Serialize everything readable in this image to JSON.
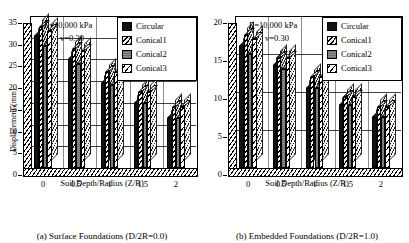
{
  "figure": {
    "series_names": [
      "Circular",
      "Conical1",
      "Conical2",
      "Conical3"
    ],
    "annotations": {
      "modulus": "E=10,000 kPa",
      "poisson": "v=0.30"
    }
  },
  "chart_data": [
    {
      "type": "bar",
      "panel": "a",
      "title": "",
      "caption": "(a) Surface Foundations (D/2R=0.0)",
      "xlabel": "Soil Depth/Radius (Z/R)",
      "ylabel": "Displacement (mm)",
      "categories": [
        "0",
        "0.5",
        "1",
        "1.5",
        "2"
      ],
      "yticks": [
        0,
        5,
        10,
        15,
        20,
        25,
        30,
        35
      ],
      "ylim": [
        0,
        35
      ],
      "grid": true,
      "legend_position": "top-right",
      "annotations": [
        "E=10,000 kPa",
        "v=0.30"
      ],
      "series": [
        {
          "name": "Circular",
          "values": [
            30.5,
            25.0,
            19.5,
            15.0,
            11.5
          ]
        },
        {
          "name": "Conical1",
          "values": [
            32.5,
            27.5,
            22.0,
            17.5,
            14.0
          ]
        },
        {
          "name": "Conical2",
          "values": [
            28.0,
            24.0,
            19.0,
            15.0,
            11.5
          ]
        },
        {
          "name": "Conical3",
          "values": [
            31.5,
            27.0,
            22.0,
            17.5,
            14.0
          ]
        }
      ]
    },
    {
      "type": "bar",
      "panel": "b",
      "title": "",
      "caption": "(b) Embedded Foundations (D/2R=1.0)",
      "xlabel": "Soil Depth/Radius (Z/R)",
      "ylabel": "Displacement (mm)",
      "categories": [
        "0",
        "0.5",
        "1",
        "1.5",
        "2"
      ],
      "yticks": [
        0,
        5,
        10,
        15,
        20
      ],
      "ylim": [
        0,
        20
      ],
      "grid": true,
      "legend_position": "top-right",
      "annotations": [
        "E=10,000 kPa",
        "v=0.30"
      ],
      "series": [
        {
          "name": "Circular",
          "values": [
            16.0,
            13.5,
            10.5,
            8.3,
            6.7
          ]
        },
        {
          "name": "Conical1",
          "values": [
            17.5,
            14.5,
            12.0,
            9.3,
            8.0
          ]
        },
        {
          "name": "Conical2",
          "values": [
            15.0,
            13.0,
            10.5,
            8.3,
            6.7
          ]
        },
        {
          "name": "Conical3",
          "values": [
            17.0,
            14.5,
            12.0,
            9.3,
            8.0
          ]
        }
      ]
    }
  ]
}
